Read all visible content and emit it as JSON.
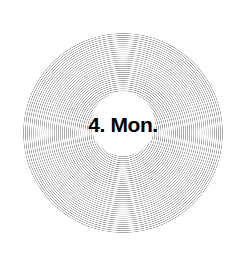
{
  "canvas": {
    "width": 242,
    "height": 265,
    "background_color": "#ffffff"
  },
  "record": {
    "name": "vinyl-record-disc",
    "center_x": 123,
    "center_y": 133,
    "radius": 100,
    "groove_color": "#a0a0a0",
    "groove_pitch_px": 2,
    "surface_color": "#ffffff"
  },
  "label": {
    "name": "record-center-label",
    "center_x": 123,
    "center_y": 124,
    "radius": 32,
    "background_color": "#ffffff",
    "text": "4. Mon.",
    "text_color": "#000000",
    "font_size_px": 21,
    "font_weight": "bold"
  }
}
